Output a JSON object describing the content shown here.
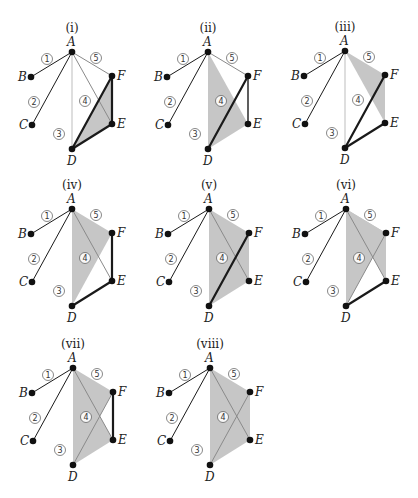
{
  "colors": {
    "shade": "#c6c6c6",
    "dark_edge": "#1a1a1a",
    "light_edge": "#bdbdbd",
    "mid_edge": "#8a8a8a",
    "vertex": "#111111"
  },
  "vertices": {
    "A": {
      "dx": 0,
      "dy": 0,
      "label": "A",
      "lx": -5,
      "ly": -6
    },
    "B": {
      "dx": -41,
      "dy": 25,
      "label": "B",
      "lx": -13,
      "ly": 4
    },
    "C": {
      "dx": -40,
      "dy": 73,
      "label": "C",
      "lx": -13,
      "ly": 4
    },
    "D": {
      "dx": 0,
      "dy": 97,
      "label": "D",
      "lx": -5,
      "ly": 16
    },
    "E": {
      "dx": 40,
      "dy": 72,
      "label": "E",
      "lx": 5,
      "ly": 4
    },
    "F": {
      "dx": 40,
      "dy": 24,
      "label": "F",
      "lx": 5,
      "ly": 4
    }
  },
  "edge_labels": [
    {
      "text": "1",
      "dx": -25,
      "dy": 7
    },
    {
      "text": "2",
      "dx": -38,
      "dy": 50
    },
    {
      "text": "3",
      "dx": -13,
      "dy": 82
    },
    {
      "text": "4",
      "dx": 13,
      "dy": 49
    },
    {
      "text": "5",
      "dx": 24,
      "dy": 6
    }
  ],
  "panels": [
    {
      "title": "(i)",
      "ax": 72,
      "ay": 52,
      "shaded": [
        [
          "D",
          "E",
          "F"
        ]
      ],
      "edges": [
        [
          "A",
          "B",
          "dark",
          1
        ],
        [
          "A",
          "C",
          "dark",
          1
        ],
        [
          "A",
          "D",
          "light",
          1
        ],
        [
          "A",
          "E",
          "mid",
          1
        ],
        [
          "A",
          "F",
          "mid",
          1
        ],
        [
          "D",
          "F",
          "dark",
          2.2
        ],
        [
          "F",
          "E",
          "dark",
          2.2
        ],
        [
          "D",
          "E",
          "dark",
          2.2
        ]
      ]
    },
    {
      "title": "(ii)",
      "ax": 208,
      "ay": 52,
      "shaded": [
        [
          "A",
          "D",
          "E"
        ]
      ],
      "edges": [
        [
          "A",
          "B",
          "dark",
          1
        ],
        [
          "A",
          "C",
          "dark",
          1
        ],
        [
          "A",
          "F",
          "mid",
          1
        ],
        [
          "D",
          "F",
          "dark",
          2.2
        ],
        [
          "F",
          "E",
          "dark",
          1.4
        ]
      ]
    },
    {
      "title": "(iii)",
      "ax": 345,
      "ay": 51,
      "shaded": [
        [
          "A",
          "F",
          "E"
        ]
      ],
      "edges": [
        [
          "A",
          "B",
          "dark",
          1
        ],
        [
          "A",
          "C",
          "dark",
          1
        ],
        [
          "A",
          "D",
          "light",
          1
        ],
        [
          "D",
          "F",
          "dark",
          2.2
        ],
        [
          "D",
          "E",
          "dark",
          2.2
        ]
      ]
    },
    {
      "title": "(iv)",
      "ax": 72,
      "ay": 209,
      "shaded": [
        [
          "A",
          "D",
          "F"
        ]
      ],
      "edges": [
        [
          "A",
          "B",
          "dark",
          1
        ],
        [
          "A",
          "C",
          "dark",
          1
        ],
        [
          "A",
          "E",
          "mid",
          1
        ],
        [
          "F",
          "E",
          "dark",
          2.2
        ],
        [
          "D",
          "E",
          "dark",
          2.2
        ]
      ]
    },
    {
      "title": "(v)",
      "ax": 209,
      "ay": 209,
      "shaded": [
        [
          "A",
          "F",
          "E",
          "D"
        ]
      ],
      "edges": [
        [
          "A",
          "B",
          "dark",
          1
        ],
        [
          "A",
          "C",
          "dark",
          1
        ],
        [
          "A",
          "E",
          "mid",
          1
        ],
        [
          "D",
          "F",
          "dark",
          2.2
        ]
      ]
    },
    {
      "title": "(vi)",
      "ax": 346,
      "ay": 209,
      "shaded": [
        [
          "A",
          "F",
          "E"
        ],
        [
          "A",
          "D",
          "F"
        ]
      ],
      "edges": [
        [
          "A",
          "B",
          "dark",
          1
        ],
        [
          "A",
          "C",
          "dark",
          1
        ],
        [
          "A",
          "E",
          "mid",
          1
        ],
        [
          "D",
          "F",
          "mid",
          1
        ],
        [
          "D",
          "E",
          "dark",
          2.2
        ]
      ]
    },
    {
      "title": "(vii)",
      "ax": 73,
      "ay": 368,
      "shaded": [
        [
          "A",
          "D",
          "F"
        ],
        [
          "A",
          "D",
          "E"
        ]
      ],
      "edges": [
        [
          "A",
          "B",
          "dark",
          1
        ],
        [
          "A",
          "C",
          "dark",
          1
        ],
        [
          "A",
          "E",
          "mid",
          1
        ],
        [
          "D",
          "F",
          "mid",
          1
        ],
        [
          "F",
          "E",
          "dark",
          2.2
        ]
      ]
    },
    {
      "title": "(viii)",
      "ax": 210,
      "ay": 368,
      "shaded": [
        [
          "A",
          "F",
          "E",
          "D"
        ]
      ],
      "edges": [
        [
          "A",
          "B",
          "dark",
          1
        ],
        [
          "A",
          "C",
          "dark",
          1
        ],
        [
          "A",
          "E",
          "mid",
          1
        ],
        [
          "D",
          "F",
          "mid",
          1
        ]
      ]
    }
  ]
}
